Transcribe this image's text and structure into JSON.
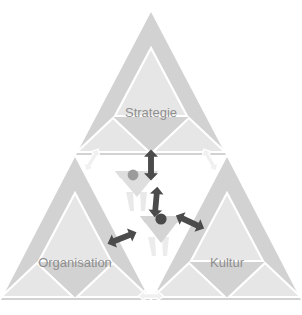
{
  "diagram": {
    "type": "sierpinski-triangle-model",
    "background_color": "#ffffff",
    "colors": {
      "outer_triangle_fill": "#d2d2d2",
      "inner_triangle_fill": "#e2e2e2",
      "inner_triangle_stroke": "#ffffff",
      "label_color": "#8f8f8f",
      "dark_arrow_fill": "#4a4a4a",
      "light_arrow_fill": "#f2f2f2",
      "light_arrow_stroke": "#ffffff",
      "figure_body_fill": "#d8d8d8",
      "figure_head_fill": "#9a9a9a",
      "figure_head_dark_fill": "#4a4a4a",
      "figure_body_light_fill": "#e8e8e8"
    },
    "corners": [
      {
        "id": "top",
        "label": "Strategie"
      },
      {
        "id": "left",
        "label": "Organisation"
      },
      {
        "id": "right",
        "label": "Kultur"
      }
    ],
    "figures": [
      {
        "id": "figure-upper",
        "name": "person-upper"
      },
      {
        "id": "figure-lower",
        "name": "person-lower"
      }
    ],
    "arrows": [
      {
        "id": "arrow-dark-vertical-top",
        "style": "dark",
        "orientation": "vertical",
        "heads": "double"
      },
      {
        "id": "arrow-dark-vertical-middle",
        "style": "dark",
        "orientation": "vertical",
        "heads": "double"
      },
      {
        "id": "arrow-dark-diagonal-left",
        "style": "dark",
        "orientation": "diagonal",
        "heads": "double"
      },
      {
        "id": "arrow-dark-diagonal-right",
        "style": "dark",
        "orientation": "diagonal",
        "heads": "double"
      },
      {
        "id": "arrow-light-upper-left",
        "style": "light",
        "orientation": "diagonal",
        "heads": "double"
      },
      {
        "id": "arrow-light-upper-right",
        "style": "light",
        "orientation": "diagonal",
        "heads": "double"
      },
      {
        "id": "arrow-light-bottom-center",
        "style": "light",
        "orientation": "horizontal",
        "heads": "double"
      }
    ]
  }
}
